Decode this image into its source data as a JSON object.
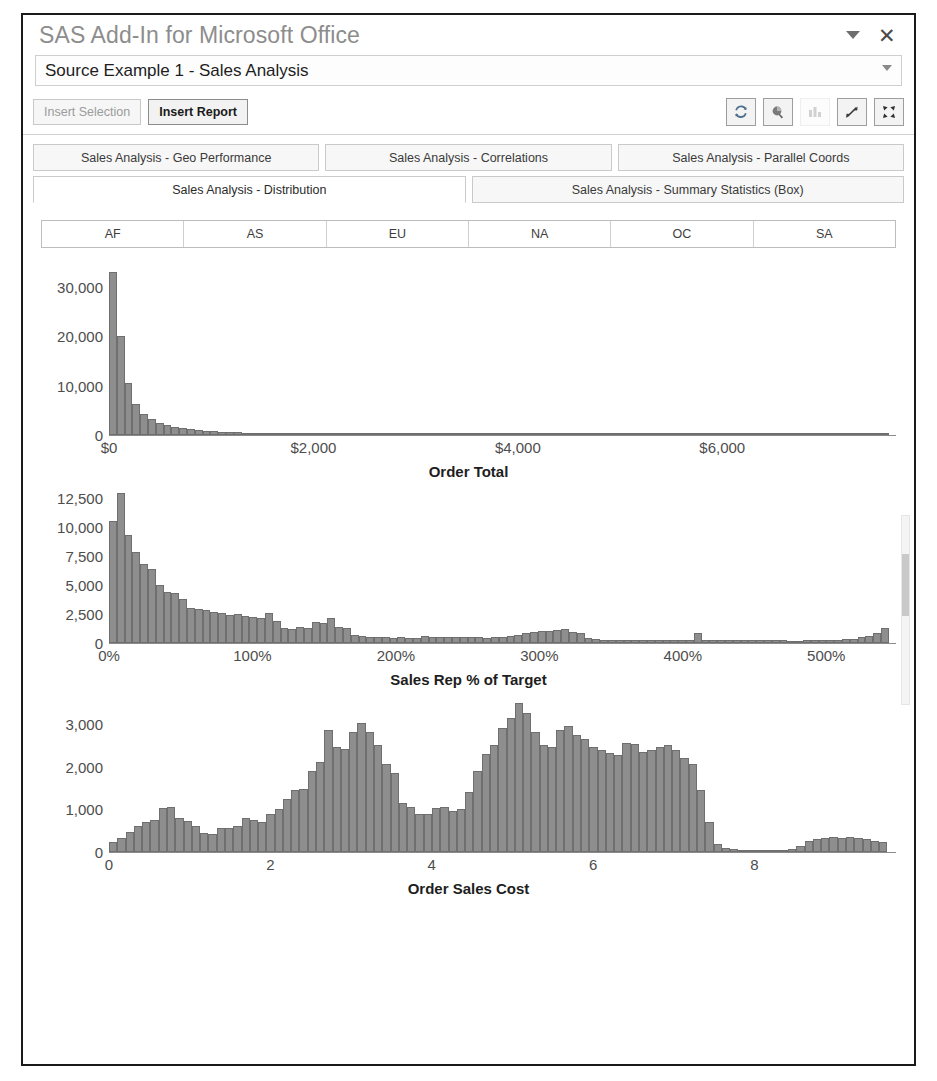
{
  "top_fragment": "S",
  "window": {
    "title": "SAS Add-In for Microsoft Office",
    "dropdown_icon": "chevron-down-icon",
    "close_icon": "close-icon"
  },
  "source": {
    "value": "Source Example 1 - Sales Analysis",
    "caret_icon": "chevron-down-icon"
  },
  "toolbar": {
    "insert_selection_label": "Insert Selection",
    "insert_report_label": "Insert Report",
    "icons": [
      {
        "name": "refresh-icon",
        "enabled": true
      },
      {
        "name": "filter-icon",
        "enabled": true
      },
      {
        "name": "bar-chart-icon",
        "enabled": false
      },
      {
        "name": "expand-diagonal-icon",
        "enabled": true
      },
      {
        "name": "fullscreen-icon",
        "enabled": true
      }
    ]
  },
  "tabs": {
    "row1": [
      {
        "label": "Sales Analysis - Geo Performance",
        "active": false
      },
      {
        "label": "Sales Analysis - Correlations",
        "active": false
      },
      {
        "label": "Sales Analysis - Parallel Coords",
        "active": false
      }
    ],
    "row2": [
      {
        "label": "Sales Analysis - Distribution",
        "active": true
      },
      {
        "label": "Sales Analysis - Summary Statistics (Box)",
        "active": false
      }
    ]
  },
  "regions": [
    "AF",
    "AS",
    "EU",
    "NA",
    "OC",
    "SA"
  ],
  "colors": {
    "bar_fill": "#8e8e8e",
    "bar_stroke": "#6f6f6f",
    "title_grey": "#8d8d8d",
    "axis": "#8b8b8b"
  },
  "chart_data": [
    {
      "type": "bar",
      "title": "",
      "xlabel": "Order Total",
      "ylabel": "",
      "xticks": [
        "$0",
        "$2,000",
        "$4,000",
        "$6,000"
      ],
      "xtick_positions": [
        0,
        28.5,
        57,
        85.5
      ],
      "yticks": [
        "0",
        "10,000",
        "20,000",
        "30,000"
      ],
      "ylim": [
        0,
        35000
      ],
      "xlim": [
        0,
        7000
      ],
      "grid": false,
      "values": [
        33000,
        20100,
        10600,
        6200,
        4200,
        3150,
        2450,
        2000,
        1700,
        1450,
        1200,
        1050,
        900,
        780,
        690,
        610,
        540,
        470,
        420,
        380,
        340,
        305,
        275,
        250,
        225,
        205,
        185,
        170,
        155,
        142,
        130,
        120,
        110,
        102,
        94,
        87,
        80,
        74,
        69,
        64,
        59,
        55,
        51,
        47,
        44,
        41,
        38,
        35,
        33,
        31,
        29,
        27,
        25,
        23,
        22,
        20,
        19,
        18,
        17,
        16,
        15,
        14,
        13,
        12,
        12,
        11,
        10,
        10,
        9,
        9,
        8,
        8,
        7,
        7,
        6,
        6,
        6,
        5,
        5,
        5,
        4,
        4,
        4,
        4,
        3,
        3,
        3,
        3,
        3,
        2,
        2,
        2,
        2,
        2,
        2,
        2,
        1,
        1,
        1,
        1
      ]
    },
    {
      "type": "bar",
      "title": "",
      "xlabel": "Sales Rep % of Target",
      "ylabel": "",
      "xticks": [
        "0%",
        "100%",
        "200%",
        "300%",
        "400%",
        "500%"
      ],
      "xtick_positions": [
        0,
        20,
        40,
        60,
        80,
        100
      ],
      "yticks": [
        "0",
        "2,500",
        "5,000",
        "7,500",
        "10,000",
        "12,500"
      ],
      "ylim": [
        0,
        13500
      ],
      "xlim": [
        0,
        500
      ],
      "grid": false,
      "values": [
        10500,
        12900,
        9300,
        7800,
        6800,
        6400,
        5000,
        4400,
        4300,
        3800,
        3000,
        2900,
        2850,
        2700,
        2600,
        2450,
        2500,
        2300,
        2250,
        2150,
        2600,
        1900,
        1250,
        1200,
        1350,
        1300,
        1800,
        1700,
        2150,
        1400,
        1300,
        700,
        620,
        560,
        520,
        480,
        430,
        520,
        470,
        450,
        600,
        560,
        540,
        520,
        560,
        520,
        500,
        480,
        470,
        500,
        560,
        620,
        700,
        900,
        950,
        1050,
        1000,
        1150,
        1200,
        950,
        900,
        400,
        330,
        300,
        280,
        270,
        260,
        255,
        250,
        245,
        240,
        240,
        235,
        230,
        230,
        900,
        300,
        250,
        240,
        235,
        230,
        230,
        225,
        225,
        220,
        220,
        220,
        215,
        215,
        230,
        240,
        250,
        270,
        300,
        330,
        380,
        480,
        620,
        900,
        1300
      ]
    },
    {
      "type": "bar",
      "title": "",
      "xlabel": "Order Sales Cost",
      "ylabel": "",
      "xticks": [
        "0",
        "2",
        "4",
        "6",
        "8"
      ],
      "xtick_positions": [
        0,
        22.5,
        45,
        67.5,
        90
      ],
      "yticks": [
        "0",
        "1,000",
        "2,000",
        "3,000"
      ],
      "ylim": [
        0,
        3700
      ],
      "xlim": [
        0,
        9
      ],
      "grid": false,
      "values": [
        230,
        330,
        480,
        620,
        700,
        760,
        1020,
        1060,
        800,
        720,
        620,
        450,
        420,
        560,
        560,
        620,
        800,
        760,
        700,
        900,
        1000,
        1250,
        1450,
        1480,
        1900,
        2100,
        2850,
        2450,
        2420,
        2800,
        3020,
        2800,
        2500,
        2050,
        1850,
        1150,
        1050,
        900,
        880,
        1020,
        1050,
        960,
        1000,
        1400,
        1900,
        2300,
        2500,
        2900,
        3150,
        3500,
        3250,
        2800,
        2500,
        2450,
        2850,
        2950,
        2750,
        2650,
        2450,
        2400,
        2320,
        2280,
        2550,
        2520,
        2350,
        2400,
        2450,
        2500,
        2400,
        2200,
        2050,
        1450,
        700,
        180,
        90,
        60,
        50,
        45,
        40,
        40,
        40,
        45,
        60,
        140,
        260,
        300,
        320,
        360,
        330,
        350,
        330,
        300,
        250,
        230
      ]
    }
  ],
  "scrollbar": {
    "name": "vertical-scrollbar"
  }
}
